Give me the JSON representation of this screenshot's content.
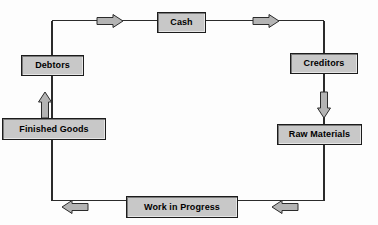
{
  "diagram": {
    "type": "cycle-flow-diagram",
    "colors": {
      "node_fill": "#c8c8c8",
      "node_border": "#1c1c1c",
      "arrow_fill": "#b4b4b4",
      "arrow_border": "#2b2b2b",
      "connector_line": "#2b2b2b",
      "background": "#fdfdfd",
      "text": "#000000"
    },
    "nodes": [
      {
        "id": "cash",
        "label": "Cash",
        "x": 157,
        "y": 12,
        "w": 49,
        "h": 21
      },
      {
        "id": "creditors",
        "label": "Creditors",
        "x": 290,
        "y": 53,
        "w": 68,
        "h": 21
      },
      {
        "id": "raw_materials",
        "label": "Raw Materials",
        "x": 277,
        "y": 124,
        "w": 85,
        "h": 21
      },
      {
        "id": "work_in_progress",
        "label": "Work in Progress",
        "x": 126,
        "y": 196,
        "w": 112,
        "h": 22
      },
      {
        "id": "finished_goods",
        "label": "Finished Goods",
        "x": 2,
        "y": 118,
        "w": 104,
        "h": 22
      },
      {
        "id": "debtors",
        "label": "Debtors",
        "x": 21,
        "y": 55,
        "w": 63,
        "h": 21
      }
    ],
    "arrows": [
      {
        "id": "arrow-debtors-to-cash",
        "direction": "right",
        "x": 97,
        "y": 15,
        "w": 26,
        "h": 12
      },
      {
        "id": "arrow-cash-to-creditors",
        "direction": "right",
        "x": 253,
        "y": 15,
        "w": 26,
        "h": 12
      },
      {
        "id": "arrow-creditors-to-raw-materials",
        "direction": "down",
        "x": 318,
        "y": 92,
        "w": 12,
        "h": 26
      },
      {
        "id": "arrow-raw-materials-to-wip",
        "direction": "left",
        "x": 272,
        "y": 201,
        "w": 26,
        "h": 12
      },
      {
        "id": "arrow-wip-to-finished-goods",
        "direction": "left",
        "x": 62,
        "y": 201,
        "w": 26,
        "h": 12
      },
      {
        "id": "arrow-finished-goods-to-debtors",
        "direction": "up",
        "x": 40,
        "y": 92,
        "w": 12,
        "h": 26
      }
    ],
    "connectors": [
      {
        "id": "connector-top-left",
        "from": "debtors",
        "to": "cash"
      },
      {
        "id": "connector-top-right",
        "from": "cash",
        "to": "creditors"
      },
      {
        "id": "connector-right",
        "from": "creditors",
        "to": "raw_materials"
      },
      {
        "id": "connector-bottom-right",
        "from": "raw_materials",
        "to": "work_in_progress"
      },
      {
        "id": "connector-bottom-left",
        "from": "work_in_progress",
        "to": "finished_goods"
      },
      {
        "id": "connector-left",
        "from": "finished_goods",
        "to": "debtors"
      }
    ]
  }
}
